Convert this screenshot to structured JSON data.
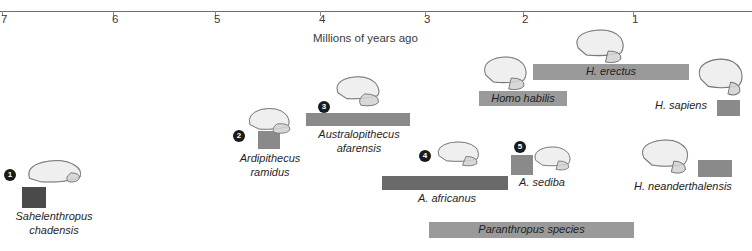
{
  "axis": {
    "caption": "Millions of years ago",
    "ticks": [
      {
        "value": "7",
        "x": 2
      },
      {
        "value": "6",
        "x": 113
      },
      {
        "value": "5",
        "x": 215
      },
      {
        "value": "4",
        "x": 320
      },
      {
        "value": "3",
        "x": 425
      },
      {
        "value": "2",
        "x": 523
      },
      {
        "value": "1",
        "x": 633
      }
    ],
    "unit": "Ma",
    "direction": "oldest-left"
  },
  "colors": {
    "axis_line": "#6e6e6e",
    "bar_dark": "#4a4a4a",
    "bar_medium": "#7d7d7d",
    "bar_light": "#9a9a9a",
    "badge": "#1a1a1a",
    "background": "#ffffff"
  },
  "chart_data": {
    "type": "bar",
    "title": "",
    "xlabel": "Millions of years ago",
    "ylabel": "",
    "xlim": [
      7.2,
      0.4
    ],
    "grid": false,
    "legend": null,
    "orientation": "horizontal-timeline",
    "categories": [
      "Sahelanthropus chadensis",
      "Ardipithecus ramidus",
      "Australopithecus afarensis",
      "A. africanus",
      "A. sediba",
      "Homo habilis",
      "H. erectus",
      "H. sapiens",
      "H. neanderthalensis",
      "Paranthropus species"
    ],
    "series": [
      {
        "name": "Temporal range (Ma)",
        "ranges": [
          {
            "label": "Sahelanthropus chadensis",
            "start": 7.1,
            "end": 6.8
          },
          {
            "label": "Ardipithecus ramidus",
            "start": 4.6,
            "end": 4.3
          },
          {
            "label": "Australopithecus afarensis",
            "start": 3.9,
            "end": 2.9
          },
          {
            "label": "A. africanus",
            "start": 3.3,
            "end": 2.1
          },
          {
            "label": "A. sediba",
            "start": 2.0,
            "end": 1.8
          },
          {
            "label": "Homo habilis",
            "start": 2.4,
            "end": 1.6
          },
          {
            "label": "H. erectus",
            "start": 1.9,
            "end": 0.5
          },
          {
            "label": "H. sapiens",
            "start": 0.4,
            "end": 0.0
          },
          {
            "label": "H. neanderthalensis",
            "start": 0.5,
            "end": 0.1
          },
          {
            "label": "Paranthropus species",
            "start": 2.7,
            "end": 1.0
          }
        ]
      }
    ]
  },
  "specimens": [
    {
      "number": "1",
      "name_line1": "Sahelenthropus",
      "name_line2": "chadensis",
      "bar": {
        "x": 22,
        "y": 187,
        "w": 24,
        "h": 21,
        "color": "#4a4a4a"
      },
      "badge": {
        "x": 4,
        "y": 169
      },
      "skull": {
        "x": 22,
        "y": 155,
        "w": 62,
        "h": 34,
        "type": "sahelanthropus"
      },
      "caption": {
        "x": 0,
        "y": 210,
        "w": 108,
        "align": "center"
      }
    },
    {
      "number": "2",
      "name_line1": "Ardipithecus",
      "name_line2": "ramidus",
      "bar": {
        "x": 258,
        "y": 131,
        "w": 22,
        "h": 18,
        "color": "#8a8a8a"
      },
      "badge": {
        "x": 233,
        "y": 130
      },
      "skull": {
        "x": 244,
        "y": 105,
        "w": 56,
        "h": 34,
        "type": "ardipithecus"
      },
      "caption": {
        "x": 224,
        "y": 152,
        "w": 92,
        "align": "center"
      }
    },
    {
      "number": "3",
      "name_line1": "Australopithecus",
      "name_line2": "afarensis",
      "bar": {
        "x": 306,
        "y": 113,
        "w": 104,
        "h": 13,
        "color": "#8a8a8a"
      },
      "badge": {
        "x": 318,
        "y": 101
      },
      "skull": {
        "x": 331,
        "y": 74,
        "w": 58,
        "h": 36,
        "type": "afarensis"
      },
      "caption": {
        "x": 304,
        "y": 128,
        "w": 110,
        "align": "center"
      }
    },
    {
      "number": "4",
      "name_line1": "A. africanus",
      "name_line2": "",
      "bar": {
        "x": 382,
        "y": 176,
        "w": 126,
        "h": 14,
        "color": "#6a6a6a"
      },
      "badge": {
        "x": 419,
        "y": 150
      },
      "skull": {
        "x": 432,
        "y": 140,
        "w": 56,
        "h": 33,
        "type": "africanus"
      },
      "caption": {
        "x": 392,
        "y": 192,
        "w": 110,
        "align": "center"
      }
    },
    {
      "number": "5",
      "name_line1": "A. sediba",
      "name_line2": "",
      "bar": {
        "x": 511,
        "y": 155,
        "w": 22,
        "h": 20,
        "color": "#8a8a8a"
      },
      "badge": {
        "x": 514,
        "y": 141
      },
      "skull": {
        "x": 530,
        "y": 145,
        "w": 52,
        "h": 32,
        "type": "sediba"
      },
      "caption": {
        "x": 504,
        "y": 176,
        "w": 76,
        "align": "center"
      }
    }
  ],
  "homo_bars": [
    {
      "name": "Homo habilis",
      "bar": {
        "x": 479,
        "y": 91,
        "w": 88,
        "h": 15,
        "color": "#9a9a9a"
      },
      "skull": {
        "x": 479,
        "y": 55,
        "w": 56,
        "h": 38,
        "type": "habilis"
      },
      "label_on_bar": true
    },
    {
      "name": "H. erectus",
      "bar": {
        "x": 533,
        "y": 64,
        "w": 156,
        "h": 16,
        "color": "#9a9a9a"
      },
      "skull": {
        "x": 570,
        "y": 28,
        "w": 60,
        "h": 38,
        "type": "erectus"
      },
      "label_on_bar": true
    },
    {
      "name": "Paranthropus species",
      "bar": {
        "x": 429,
        "y": 222,
        "w": 205,
        "h": 16,
        "color": "#9a9a9a"
      },
      "skull": null,
      "label_on_bar": true
    }
  ],
  "side_labeled": [
    {
      "name": "H. sapiens",
      "bar": {
        "x": 717,
        "y": 100,
        "w": 23,
        "h": 16,
        "color": "#8a8a8a"
      },
      "skull": {
        "x": 694,
        "y": 58,
        "w": 56,
        "h": 40,
        "type": "sapiens"
      },
      "label": {
        "x": 655,
        "y": 99
      }
    },
    {
      "name": "H. neanderthalensis",
      "bar": {
        "x": 698,
        "y": 160,
        "w": 34,
        "h": 17,
        "color": "#8a8a8a"
      },
      "skull": {
        "x": 637,
        "y": 138,
        "w": 58,
        "h": 38,
        "type": "neanderthalensis"
      },
      "label": {
        "x": 634,
        "y": 180
      }
    }
  ]
}
